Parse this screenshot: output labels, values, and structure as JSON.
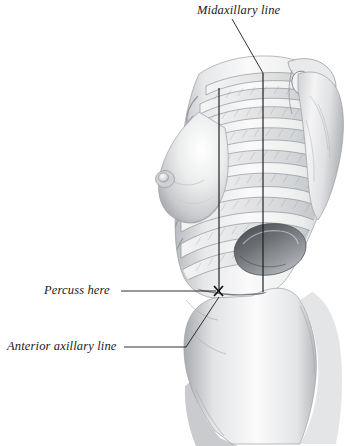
{
  "figure": {
    "kind": "anatomical-illustration",
    "orientation": "right lateral view",
    "background_color": "#ffffff",
    "line_color": "#1a1a1a",
    "shading_color": "#8e9094",
    "width": 347,
    "height": 446
  },
  "labels": {
    "midaxillary": "Midaxillary line",
    "percuss": "Percuss here",
    "anterior_axillary": "Anterior axillary line"
  },
  "markers": {
    "percussion_point": "X"
  },
  "reference_lines": [
    {
      "name": "anterior-axillary-line",
      "label": "Anterior axillary line",
      "x": 219,
      "y_top": 88,
      "y_bottom": 292
    },
    {
      "name": "midaxillary-line",
      "label": "Midaxillary line",
      "x": 263,
      "y_top": 73,
      "y_bottom": 292
    }
  ],
  "leaders": {
    "midaxillary": "M232,19 L263,73",
    "percuss": "M121,291 L217,291",
    "anterior_axillary": "M124,347 L186,347 L219,296"
  }
}
